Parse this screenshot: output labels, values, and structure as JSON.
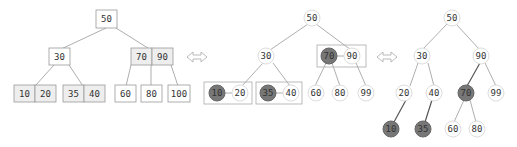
{
  "diagram": {
    "colors": {
      "red_link_node": "#777777",
      "black_node": "#ffffff",
      "border": "#999999"
    },
    "panel_23tree": {
      "root": "50",
      "level1": [
        "30",
        "70 90"
      ],
      "level2": [
        "10 20",
        "35 40",
        "60",
        "80",
        "100"
      ],
      "labels": {
        "n50": "50",
        "n30": "30",
        "n70": "70",
        "n90": "90",
        "n10": "10",
        "n20": "20",
        "n35": "35",
        "n40": "40",
        "n60": "60",
        "n80": "80",
        "n100": "100"
      }
    },
    "panel_grouped": {
      "labels": {
        "n50": "50",
        "n30": "30",
        "n70": "70",
        "n90": "90",
        "n10": "10",
        "n20": "20",
        "n35": "35",
        "n40": "40",
        "n60": "60",
        "n80": "80",
        "n99": "99"
      },
      "red_nodes": [
        "10",
        "35",
        "70"
      ]
    },
    "panel_rbtree": {
      "labels": {
        "n50": "50",
        "n30": "30",
        "n90": "90",
        "n20": "20",
        "n40": "40",
        "n70": "70",
        "n99": "99",
        "n10": "10",
        "n35": "35",
        "n60": "60",
        "n80": "80"
      },
      "red_nodes": [
        "10",
        "35",
        "70"
      ]
    },
    "arrows": [
      "double-arrow-1",
      "double-arrow-2"
    ]
  }
}
